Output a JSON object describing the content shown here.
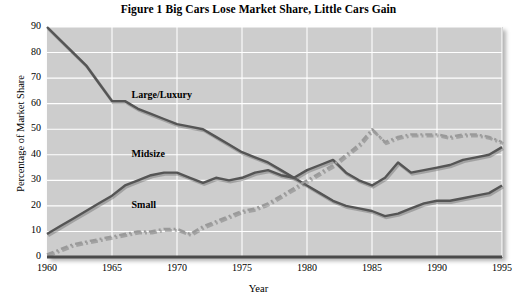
{
  "figure": {
    "title": "Figure 1  Big Cars Lose Market Share, Little Cars Gain"
  },
  "chart_data": {
    "type": "line",
    "title": "Figure 1  Big Cars Lose Market Share, Little Cars Gain",
    "xlabel": "Year",
    "ylabel": "Percentage of Market Share",
    "xlim": [
      1960,
      1995
    ],
    "ylim": [
      0,
      90
    ],
    "ytick_labels": [
      "0",
      "10",
      "20",
      "30",
      "40",
      "50",
      "60",
      "70",
      "80",
      "90"
    ],
    "ytick_values": [
      0,
      10,
      20,
      30,
      40,
      50,
      60,
      70,
      80,
      90
    ],
    "xtick_labels": [
      "1960",
      "1965",
      "1970",
      "1975",
      "1980",
      "1985",
      "1990",
      "1995"
    ],
    "xtick_values": [
      1960,
      1965,
      1970,
      1975,
      1980,
      1985,
      1990,
      1995
    ],
    "grid": true,
    "legend_position": "inline-annotations",
    "x": [
      1960,
      1961,
      1962,
      1963,
      1964,
      1965,
      1966,
      1967,
      1968,
      1969,
      1970,
      1971,
      1972,
      1973,
      1974,
      1975,
      1976,
      1977,
      1978,
      1979,
      1980,
      1981,
      1982,
      1983,
      1984,
      1985,
      1986,
      1987,
      1988,
      1989,
      1990,
      1991,
      1992,
      1993,
      1994,
      1995
    ],
    "series": [
      {
        "name": "Large/Luxury",
        "style": "solid",
        "color": "#555555",
        "values": [
          90,
          85,
          80,
          75,
          68,
          61,
          61,
          58,
          56,
          54,
          52,
          51,
          50,
          47,
          44,
          41,
          39,
          37,
          34,
          31,
          28,
          25,
          22,
          20,
          19,
          18,
          16,
          17,
          19,
          21,
          22,
          22,
          23,
          24,
          25,
          28
        ]
      },
      {
        "name": "Midsize",
        "style": "solid",
        "color": "#555555",
        "values": [
          9,
          12,
          15,
          18,
          21,
          24,
          28,
          30,
          32,
          33,
          33,
          31,
          29,
          31,
          30,
          31,
          33,
          34,
          32,
          31,
          34,
          36,
          38,
          33,
          30,
          28,
          31,
          37,
          33,
          34,
          35,
          36,
          38,
          39,
          40,
          43
        ]
      },
      {
        "name": "Small",
        "style": "dash-dot",
        "color": "#9a9a9a",
        "values": [
          1,
          3,
          5,
          6,
          7,
          8,
          9,
          10,
          10,
          11,
          11,
          9,
          12,
          14,
          16,
          18,
          19,
          21,
          24,
          27,
          30,
          33,
          36,
          40,
          44,
          50,
          45,
          47,
          48,
          48,
          48,
          47,
          48,
          48,
          47,
          45
        ]
      }
    ],
    "annotations": [
      {
        "text": "Large/Luxury",
        "x": 1966.5,
        "y": 63
      },
      {
        "text": "Midsize",
        "x": 1966.5,
        "y": 40
      },
      {
        "text": "Small",
        "x": 1966.5,
        "y": 20
      }
    ]
  }
}
